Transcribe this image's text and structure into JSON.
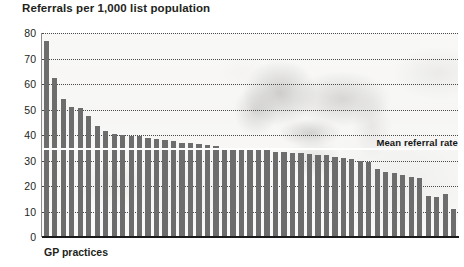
{
  "chart_data": {
    "type": "bar",
    "title": "Referrals per 1,000 list population",
    "xlabel": "GP practices",
    "ylabel": "",
    "ylim": [
      0,
      80
    ],
    "ytick_labels": [
      "80",
      "70",
      "60",
      "50",
      "40",
      "30",
      "20",
      "10",
      "0"
    ],
    "ytick_values": [
      80,
      70,
      60,
      50,
      40,
      30,
      20,
      10,
      0
    ],
    "grid": "horizontal-dotted",
    "legend": "none",
    "categories": [
      "P1",
      "P2",
      "P3",
      "P4",
      "P5",
      "P6",
      "P7",
      "P8",
      "P9",
      "P10",
      "P11",
      "P12",
      "P13",
      "P14",
      "P15",
      "P16",
      "P17",
      "P18",
      "P19",
      "P20",
      "P21",
      "P22",
      "P23",
      "P24",
      "P25",
      "P26",
      "P27",
      "P28",
      "P29",
      "P30",
      "P31",
      "P32",
      "P33",
      "P34",
      "P35",
      "P36",
      "P37",
      "P38",
      "P39",
      "P40",
      "P41",
      "P42",
      "P43",
      "P44",
      "P45",
      "P46",
      "P47",
      "P48",
      "P49"
    ],
    "values": [
      77,
      62.5,
      54,
      51,
      50.5,
      47.5,
      43.5,
      41.5,
      40.5,
      40,
      39.5,
      39.5,
      39,
      38.5,
      38,
      37.5,
      37,
      37,
      36.5,
      36,
      35.5,
      35,
      35,
      34.5,
      34.5,
      34,
      34,
      33.5,
      33.5,
      33,
      33,
      32.5,
      32,
      32,
      31.5,
      31,
      30.5,
      30,
      29.5,
      26.5,
      25.5,
      25,
      24.5,
      23.5,
      23,
      16,
      15.5,
      17,
      11
    ],
    "annotations": [
      {
        "name": "mean-referral-rate",
        "text": "Mean referral rate",
        "value": 35
      }
    ],
    "series_color": "#6d6d6d",
    "mean_line_color": "#ffffff",
    "axis_color": "#1a1a1a"
  }
}
